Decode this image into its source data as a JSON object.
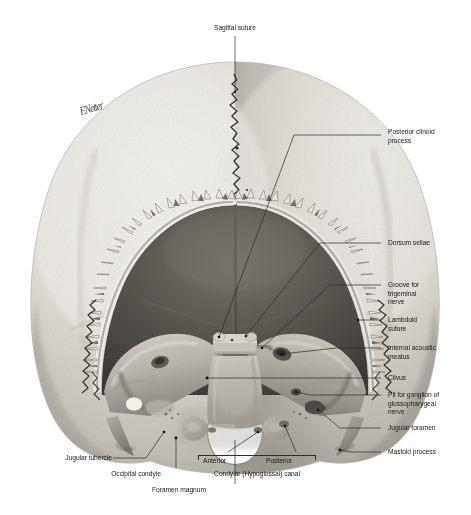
{
  "plate": {
    "domain": "anatomical-illustration",
    "view_title": "Posterior cranial fossa / skull base, posterosuperior view",
    "background_color": "#ffffff",
    "ink_color": "#2b2b2b",
    "text_color": "#1a1a1a",
    "signature": "F.Netter"
  },
  "labels": {
    "sagittal_suture": "Sagittal suture",
    "posterior_clinoid_process": "Posterior clinoid\nprocess",
    "dorsum_sellae": "Dorsum sellae",
    "groove_for_trigeminal_nerve": "Groove for\ntrigeminal\nnerve",
    "lambdoid_suture": "Lambdoid\nsuture",
    "internal_acoustic_meatus": "Internal acoustic\nmeatus",
    "clivus": "Clivus",
    "pit_for_ganglion": "Pit for ganglion of\nglossopharygeal\nnerve",
    "jugular_foramen": "Jugular foramen",
    "mastoid_process": "Mastoid process",
    "jugular_tubercle": "Jugular tubercle",
    "occipital_condyle": "Occipital condyle",
    "foramen_magnum": "Foramen magnum",
    "condylar_canal_anterior": "Anterior",
    "condylar_canal_posterior": "Posterior",
    "condylar_canal": "Condylar (Hypoglossal) canal"
  },
  "palette": {
    "bone_light": "#e9e7e2",
    "bone_mid": "#cfccc4",
    "bone_shadow": "#a8a49b",
    "fossa_dark": "#5d5a54",
    "fossa_deep": "#46433e",
    "diploe": "#6f6b63",
    "highlight": "#f6f5f2"
  }
}
